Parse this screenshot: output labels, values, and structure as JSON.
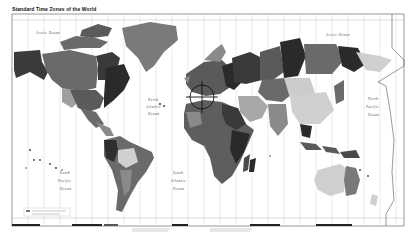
{
  "map": {
    "title": "Standard Time Zones of the World",
    "ocean_labels": [
      {
        "name": "arctic-ocean-west",
        "text": "Arctic Ocean",
        "x": 48,
        "y": 34
      },
      {
        "name": "arctic-ocean-east",
        "text": "Arctic Ocean",
        "x": 330,
        "y": 36
      },
      {
        "name": "north-atlantic-1",
        "text": "North",
        "x": 150,
        "y": 101
      },
      {
        "name": "north-atlantic-2",
        "text": "Atlantic",
        "x": 148,
        "y": 108
      },
      {
        "name": "north-atlantic-3",
        "text": "Ocean",
        "x": 150,
        "y": 115
      },
      {
        "name": "south-pacific-w-1",
        "text": "South",
        "x": 62,
        "y": 174
      },
      {
        "name": "south-pacific-w-2",
        "text": "Pacific",
        "x": 60,
        "y": 182
      },
      {
        "name": "south-pacific-w-3",
        "text": "Ocean",
        "x": 62,
        "y": 190
      },
      {
        "name": "south-atlantic-1",
        "text": "South",
        "x": 175,
        "y": 174
      },
      {
        "name": "south-atlantic-2",
        "text": "Atlantic",
        "x": 173,
        "y": 182
      },
      {
        "name": "south-atlantic-3",
        "text": "Ocean",
        "x": 175,
        "y": 190
      },
      {
        "name": "north-pacific-e-1",
        "text": "North",
        "x": 372,
        "y": 100
      },
      {
        "name": "north-pacific-e-2",
        "text": "Pacific",
        "x": 370,
        "y": 108
      },
      {
        "name": "north-pacific-e-3",
        "text": "Ocean",
        "x": 372,
        "y": 116
      }
    ],
    "colors": {
      "ocean": "#ffffff",
      "frame": "#555555",
      "gridline": "#bbbbbb",
      "zone_dark": "#2a2a2a",
      "zone_mid": "#6a6a6a",
      "zone_light": "#a8a8a8",
      "zone_pale": "#d8d8d8"
    },
    "frame": {
      "x": 12,
      "y": 14,
      "width": 392,
      "height": 212
    },
    "crosshair": {
      "cx": 202,
      "cy": 97,
      "r": 12
    }
  }
}
